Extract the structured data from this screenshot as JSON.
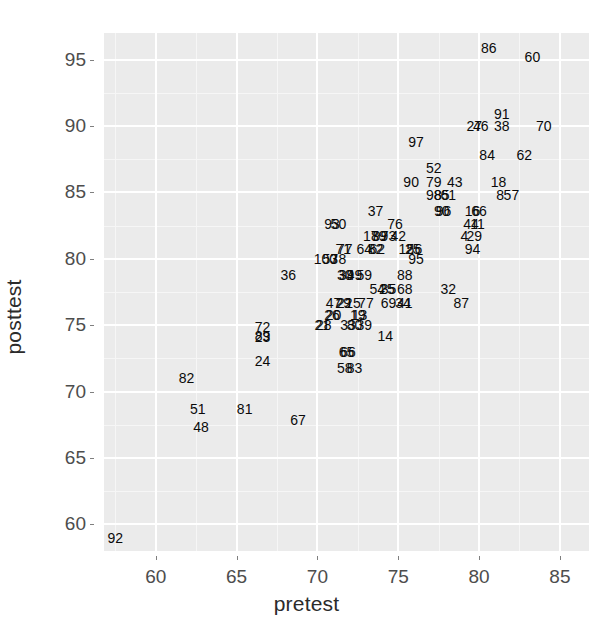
{
  "chart_data": {
    "type": "scatter",
    "title": "",
    "xlabel": "pretest",
    "ylabel": "posttest",
    "xlim": [
      56.8,
      86.8
    ],
    "ylim": [
      58.0,
      97.0
    ],
    "xticks": [
      60,
      65,
      70,
      75,
      80,
      85
    ],
    "yticks": [
      60,
      65,
      70,
      75,
      80,
      85,
      90,
      95
    ],
    "grid": true,
    "legend": null,
    "point_marker": "text-label",
    "panel_background": "#ebebeb",
    "gridline_color": "#ffffff",
    "label_color": "#0a0a0a",
    "points": [
      {
        "label": "92",
        "x": 57.5,
        "y": 59.0
      },
      {
        "label": "82",
        "x": 61.9,
        "y": 71.0
      },
      {
        "label": "51",
        "x": 62.6,
        "y": 68.7
      },
      {
        "label": "48",
        "x": 62.8,
        "y": 67.3
      },
      {
        "label": "81",
        "x": 65.5,
        "y": 68.7
      },
      {
        "label": "72",
        "x": 66.6,
        "y": 74.9
      },
      {
        "label": "89",
        "x": 66.6,
        "y": 74.2
      },
      {
        "label": "23",
        "x": 66.6,
        "y": 74.1
      },
      {
        "label": "24",
        "x": 66.6,
        "y": 72.3
      },
      {
        "label": "36",
        "x": 68.2,
        "y": 78.8
      },
      {
        "label": "67",
        "x": 68.8,
        "y": 67.9
      },
      {
        "label": "21",
        "x": 70.3,
        "y": 75.0
      },
      {
        "label": "28",
        "x": 70.4,
        "y": 75.0
      },
      {
        "label": "100",
        "x": 70.5,
        "y": 80.0
      },
      {
        "label": "53",
        "x": 70.8,
        "y": 80.0
      },
      {
        "label": "93",
        "x": 70.9,
        "y": 82.6
      },
      {
        "label": "50",
        "x": 71.3,
        "y": 82.6
      },
      {
        "label": "78",
        "x": 71.3,
        "y": 80.0
      },
      {
        "label": "47",
        "x": 71.0,
        "y": 76.7
      },
      {
        "label": "26",
        "x": 70.9,
        "y": 75.8
      },
      {
        "label": "20",
        "x": 71.0,
        "y": 75.8
      },
      {
        "label": "29",
        "x": 71.6,
        "y": 76.7
      },
      {
        "label": "22",
        "x": 71.7,
        "y": 76.7
      },
      {
        "label": "71",
        "x": 71.6,
        "y": 80.7
      },
      {
        "label": "77",
        "x": 71.7,
        "y": 80.7
      },
      {
        "label": "30",
        "x": 71.7,
        "y": 78.8
      },
      {
        "label": "39",
        "x": 71.8,
        "y": 78.8
      },
      {
        "label": "15",
        "x": 72.2,
        "y": 76.7
      },
      {
        "label": "33",
        "x": 71.9,
        "y": 75.0
      },
      {
        "label": "80",
        "x": 72.3,
        "y": 75.0
      },
      {
        "label": "65",
        "x": 71.8,
        "y": 73.0
      },
      {
        "label": "66",
        "x": 71.9,
        "y": 73.0
      },
      {
        "label": "58",
        "x": 71.7,
        "y": 71.8
      },
      {
        "label": "83",
        "x": 72.3,
        "y": 71.8
      },
      {
        "label": "49",
        "x": 72.3,
        "y": 78.8
      },
      {
        "label": "19",
        "x": 72.5,
        "y": 75.8
      },
      {
        "label": "13",
        "x": 72.6,
        "y": 75.8
      },
      {
        "label": "39",
        "x": 72.9,
        "y": 75.0
      },
      {
        "label": "59",
        "x": 72.9,
        "y": 78.8
      },
      {
        "label": "64",
        "x": 72.9,
        "y": 80.7
      },
      {
        "label": "77",
        "x": 73.0,
        "y": 76.7
      },
      {
        "label": "17",
        "x": 73.3,
        "y": 81.7
      },
      {
        "label": "37",
        "x": 73.6,
        "y": 83.6
      },
      {
        "label": "54",
        "x": 73.7,
        "y": 77.7
      },
      {
        "label": "82",
        "x": 73.6,
        "y": 80.7
      },
      {
        "label": "62",
        "x": 73.7,
        "y": 80.7
      },
      {
        "label": "89",
        "x": 73.8,
        "y": 81.7
      },
      {
        "label": "99",
        "x": 73.9,
        "y": 81.7
      },
      {
        "label": "14",
        "x": 74.2,
        "y": 74.2
      },
      {
        "label": "25",
        "x": 74.3,
        "y": 77.7
      },
      {
        "label": "35",
        "x": 74.4,
        "y": 77.7
      },
      {
        "label": "69",
        "x": 74.4,
        "y": 76.7
      },
      {
        "label": "73",
        "x": 74.4,
        "y": 81.7
      },
      {
        "label": "76",
        "x": 74.8,
        "y": 82.6
      },
      {
        "label": "42",
        "x": 75.0,
        "y": 81.7
      },
      {
        "label": "34",
        "x": 75.3,
        "y": 76.7
      },
      {
        "label": "41",
        "x": 75.4,
        "y": 76.7
      },
      {
        "label": "68",
        "x": 75.4,
        "y": 77.7
      },
      {
        "label": "88",
        "x": 75.4,
        "y": 78.8
      },
      {
        "label": "12",
        "x": 75.5,
        "y": 80.7
      },
      {
        "label": "25",
        "x": 75.9,
        "y": 80.7
      },
      {
        "label": "56",
        "x": 76.0,
        "y": 80.7
      },
      {
        "label": "95",
        "x": 76.1,
        "y": 80.0
      },
      {
        "label": "90",
        "x": 75.8,
        "y": 85.8
      },
      {
        "label": "97",
        "x": 76.1,
        "y": 88.8
      },
      {
        "label": "52",
        "x": 77.2,
        "y": 86.8
      },
      {
        "label": "79",
        "x": 77.2,
        "y": 85.8
      },
      {
        "label": "98",
        "x": 77.2,
        "y": 84.8
      },
      {
        "label": "85",
        "x": 77.7,
        "y": 84.8
      },
      {
        "label": "90",
        "x": 77.7,
        "y": 83.6
      },
      {
        "label": "96",
        "x": 77.8,
        "y": 83.6
      },
      {
        "label": "61",
        "x": 78.1,
        "y": 84.8
      },
      {
        "label": "32",
        "x": 78.1,
        "y": 77.7
      },
      {
        "label": "43",
        "x": 78.5,
        "y": 85.8
      },
      {
        "label": "87",
        "x": 78.9,
        "y": 76.7
      },
      {
        "label": "94",
        "x": 79.6,
        "y": 80.7
      },
      {
        "label": "29",
        "x": 79.7,
        "y": 81.7
      },
      {
        "label": "4",
        "x": 79.1,
        "y": 81.7
      },
      {
        "label": "44",
        "x": 79.5,
        "y": 82.6
      },
      {
        "label": "11",
        "x": 79.9,
        "y": 82.6
      },
      {
        "label": "16",
        "x": 79.6,
        "y": 83.6
      },
      {
        "label": "66",
        "x": 80.0,
        "y": 83.6
      },
      {
        "label": "27",
        "x": 79.7,
        "y": 90.0
      },
      {
        "label": "46",
        "x": 80.1,
        "y": 90.0
      },
      {
        "label": "84",
        "x": 80.5,
        "y": 87.8
      },
      {
        "label": "86",
        "x": 80.6,
        "y": 95.9
      },
      {
        "label": "18",
        "x": 81.2,
        "y": 85.8
      },
      {
        "label": "8",
        "x": 81.3,
        "y": 84.8
      },
      {
        "label": "91",
        "x": 81.4,
        "y": 90.9
      },
      {
        "label": "38",
        "x": 81.4,
        "y": 90.0
      },
      {
        "label": "57",
        "x": 82.0,
        "y": 84.8
      },
      {
        "label": "62",
        "x": 82.8,
        "y": 87.8
      },
      {
        "label": "60",
        "x": 83.3,
        "y": 95.2
      },
      {
        "label": "70",
        "x": 84.0,
        "y": 90.0
      }
    ]
  },
  "axes": {
    "x_title": "pretest",
    "y_title": "posttest",
    "x_tick_labels": [
      "60",
      "65",
      "70",
      "75",
      "80",
      "85"
    ],
    "y_tick_labels": [
      "60",
      "65",
      "70",
      "75",
      "80",
      "85",
      "90",
      "95"
    ]
  }
}
